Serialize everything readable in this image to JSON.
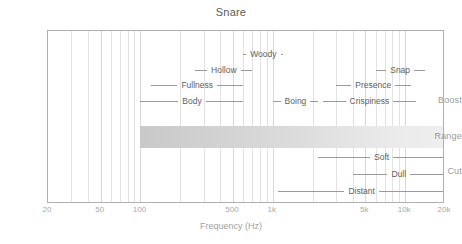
{
  "chart_data": {
    "type": "table",
    "title": "Snare",
    "xlabel": "Frequency (Hz)",
    "ylabel": "",
    "xscale": "log",
    "xlim": [
      20,
      20000
    ],
    "grid": true,
    "legend": false,
    "xticks": [
      {
        "value": 20,
        "label": "20"
      },
      {
        "value": 50,
        "label": "50"
      },
      {
        "value": 100,
        "label": "100"
      },
      {
        "value": 500,
        "label": "500"
      },
      {
        "value": 1000,
        "label": "1k"
      },
      {
        "value": 5000,
        "label": "5k"
      },
      {
        "value": 10000,
        "label": "10k"
      },
      {
        "value": 20000,
        "label": "20k"
      }
    ],
    "gridline_values": [
      20,
      30,
      40,
      50,
      60,
      70,
      80,
      90,
      100,
      200,
      300,
      400,
      500,
      600,
      700,
      800,
      900,
      1000,
      2000,
      3000,
      4000,
      5000,
      6000,
      7000,
      8000,
      9000,
      10000,
      20000
    ],
    "row_labels": [
      {
        "key": "boost",
        "label": "Boost"
      },
      {
        "key": "range",
        "label": "Range"
      },
      {
        "key": "cut",
        "label": "Cut"
      }
    ],
    "range_band": {
      "label": "Range",
      "from_hz": 100,
      "to_hz": 20000,
      "color_start": "#c9c9c9",
      "color_end": "#efefef"
    },
    "boost_bands": [
      {
        "label": "Woody",
        "from_hz": 600,
        "to_hz": 1200,
        "row": 0
      },
      {
        "label": "Hollow",
        "from_hz": 260,
        "to_hz": 700,
        "row": 1
      },
      {
        "label": "Snap",
        "from_hz": 6000,
        "to_hz": 14000,
        "row": 1
      },
      {
        "label": "Fullness",
        "from_hz": 120,
        "to_hz": 600,
        "row": 2
      },
      {
        "label": "Presence",
        "from_hz": 3000,
        "to_hz": 11000,
        "row": 2
      },
      {
        "label": "Body",
        "from_hz": 100,
        "to_hz": 600,
        "row": 3
      },
      {
        "label": "Boing",
        "from_hz": 1000,
        "to_hz": 2200,
        "row": 3
      },
      {
        "label": "Crispiness",
        "from_hz": 2400,
        "to_hz": 12000,
        "row": 3
      }
    ],
    "cut_bands": [
      {
        "label": "Soft",
        "from_hz": 2200,
        "to_hz": 20000,
        "row": 0
      },
      {
        "label": "Dull",
        "from_hz": 4000,
        "to_hz": 20000,
        "row": 1
      },
      {
        "label": "Distant",
        "from_hz": 1100,
        "to_hz": 20000,
        "row": 2
      }
    ]
  }
}
